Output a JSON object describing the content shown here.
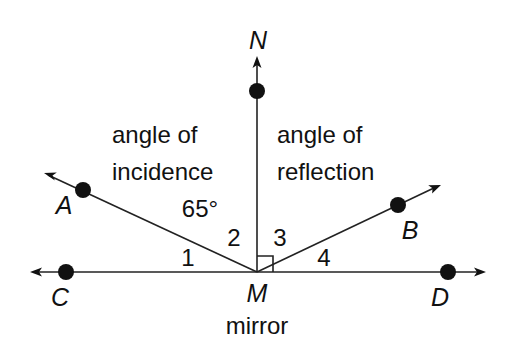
{
  "diagram": {
    "type": "angle-of-reflection",
    "points": {
      "N": {
        "label": "N"
      },
      "A": {
        "label": "A"
      },
      "B": {
        "label": "B"
      },
      "C": {
        "label": "C"
      },
      "D": {
        "label": "D"
      },
      "M": {
        "label": "M"
      }
    },
    "texts": {
      "incidence_line1": "angle of",
      "incidence_line2": "incidence",
      "incidence_value": "65°",
      "reflection_line1": "angle of",
      "reflection_line2": "reflection",
      "mirror": "mirror"
    },
    "angle_labels": {
      "a1": "1",
      "a2": "2",
      "a3": "3",
      "a4": "4"
    },
    "colors": {
      "line": "#222222",
      "background": "#ffffff"
    }
  }
}
